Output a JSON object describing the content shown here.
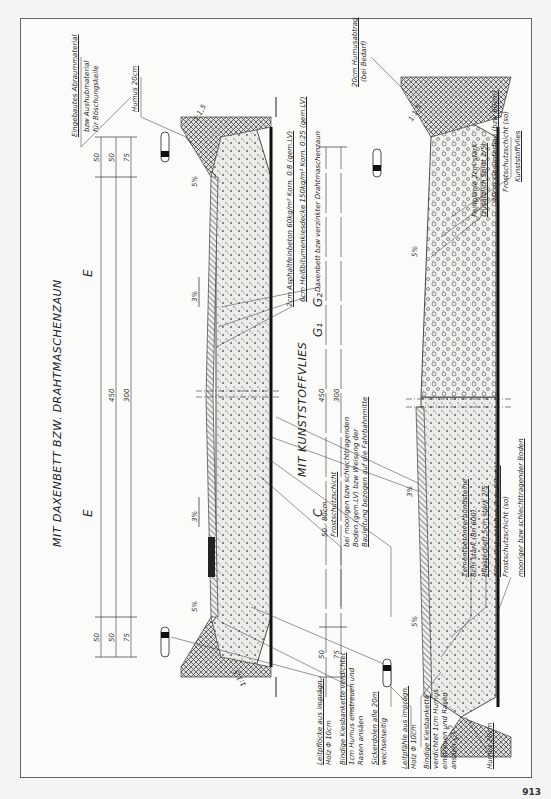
{
  "drawing": {
    "orientation": "rotated-90-ccw",
    "top_section": {
      "title": "MIT DAXENBETT BZW. DRAHTMASCHENZAUN",
      "lanes": [
        "E",
        "E"
      ],
      "dimensions": {
        "row1": [
          "50",
          "450",
          "50"
        ],
        "row2": [
          "50",
          "450",
          "50"
        ],
        "row3": [
          "75",
          "300",
          "75"
        ]
      },
      "slopes": [
        "5%",
        "3%",
        "3%",
        "5%",
        "1:1,5",
        "1:1,5"
      ],
      "left_labels": [
        {
          "text": "Leitpflöcke aus imprägn.",
          "underline": true
        },
        {
          "text": "Holz Φ 10cm",
          "underline": false
        },
        {
          "text": "Bindige Kiesbankette verdichtet",
          "underline": true
        },
        {
          "text": "1cm Humus einstreuen und",
          "underline": false
        },
        {
          "text": "Rasen ansäen",
          "underline": false
        },
        {
          "text": "Sickerdolen alle 20m",
          "underline": true
        },
        {
          "text": "wechselseitig",
          "underline": false
        }
      ],
      "bottom_labels": [
        {
          "text": "50 - 80cm",
          "underline": false
        },
        {
          "text": "Frostschutzschicht",
          "underline": true
        },
        {
          "text": "bei moorigen bzw schlechttragenden",
          "underline": false
        },
        {
          "text": "Boden (gem.LV) bzw Weisung der",
          "underline": false
        },
        {
          "text": "Bauleitung bezogen auf die Fahrbahnmitte",
          "underline": true
        },
        {
          "text": "Heißbitumentragdeckschicht 16cm (175kg/m² gem.LV) Körnung 0:16",
          "underline": true
        },
        {
          "text": "mooriger bzw schlechttragender Boden",
          "underline": false
        }
      ],
      "right_labels": [
        {
          "text": "2cm Asphaltfeinbeton 60kg/m² Korn. 0:8 (gem.LV)",
          "underline": true
        },
        {
          "text": "6cm Heißbitumenkiesdecke 150kg/m² Korn. 0:25 (gem.LV)",
          "underline": true
        },
        {
          "text": "Daxenbett bzw verzinkter Drahtmaschenzaun",
          "underline": false
        }
      ],
      "top_labels": [
        {
          "text": "Eingebautes Abraummaterial",
          "underline": true
        },
        {
          "text": "bzw Aushubmaterial",
          "underline": false
        },
        {
          "text": "für Böschungskeile",
          "underline": false
        },
        {
          "text": "Humus 20cm",
          "underline": true
        }
      ]
    },
    "bottom_section": {
      "title": "MIT KUNSTSTOFFVLIES",
      "lanes": [
        "C",
        "G₁",
        "G₂"
      ],
      "dimensions": {
        "row1": [
          "50",
          "450"
        ],
        "row2": [
          "75",
          "300"
        ]
      },
      "slopes": [
        "5%",
        "3%",
        "5%",
        "1:1,5",
        "1:1,5"
      ],
      "left_labels": [
        {
          "text": "Leitpfähle aus imprägn.",
          "underline": true
        },
        {
          "text": "Holz Φ 10cm",
          "underline": false
        },
        {
          "text": "Bindige Kiesbankette",
          "underline": true
        },
        {
          "text": "verdichtet 1cm Humus",
          "underline": false
        },
        {
          "text": "einstreuen und Rasen",
          "underline": false
        },
        {
          "text": "ansäen",
          "underline": false
        },
        {
          "text": "Humus 20cm",
          "underline": true
        }
      ],
      "bottom_labels": [
        {
          "text": "Zementbetonverbundsteine",
          "underline": true
        },
        {
          "text": "8cm stark (Bn 600)",
          "underline": false
        },
        {
          "text": "Pflasterbett 5cm stark 2/5",
          "underline": true
        },
        {
          "text": "40cm Kiesunterbau (bzw 60cm)",
          "underline": true
        },
        {
          "text": "Frostschutzschicht (so)",
          "underline": false
        },
        {
          "text": "mooriger bzw schlechttragender Boden",
          "underline": true
        }
      ],
      "right_labels": [
        {
          "text": "Feinplanie 2cm stark",
          "underline": false
        },
        {
          "text": "(zusätzlich Splitt 2/5)",
          "underline": true
        },
        {
          "text": "40cm Kiesunterbau (bzw 60cm)",
          "underline": true
        },
        {
          "text": "Frostschutzschicht (so)",
          "underline": false
        },
        {
          "text": "Kunststoffvlies",
          "underline": true
        }
      ],
      "top_labels": [
        {
          "text": "20cm Humusabtrag",
          "underline": true
        },
        {
          "text": "(bei Bedarf)",
          "underline": false
        }
      ]
    },
    "page_number": "913"
  },
  "colors": {
    "paper": "#fbfbf9",
    "ink": "#222222",
    "fill_gravel": "#e6e6e2",
    "fill_dark": "#333333"
  }
}
